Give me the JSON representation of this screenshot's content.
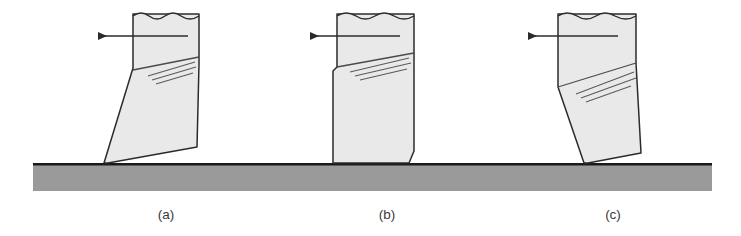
{
  "figure": {
    "background_color": "#ffffff",
    "width": 741,
    "height": 236,
    "workpiece": {
      "name": "workpiece-bar",
      "fill_color": "#9a9a9a",
      "edge_color": "#1a1a1a",
      "x": 33,
      "y": 163,
      "width": 679,
      "height": 28,
      "top_edge_thickness": 2.6
    },
    "tool_fill_color": "#e9e9e9",
    "tool_stroke_color": "#2b2b2b",
    "arrow_color": "#2b2b2b",
    "rake_line_color": "#5a5a5a",
    "panels": [
      {
        "id": "panel-a",
        "caption": "(a)",
        "caption_x": 166,
        "caption_y": 219,
        "rake_type": "positive-rake",
        "arrow": {
          "name": "feed-direction-arrow",
          "direction": "left",
          "tail_x": 188,
          "tip_x": 98,
          "y": 36
        },
        "tool_outline": "133,14 133,68 104,163 108,163 197,147 199,64 199,14",
        "break_line_y": 14,
        "break_line_x1": 133,
        "break_line_x2": 199,
        "rake_face_line": "133,70 199,57",
        "rake_marks": [
          "148,76 195,62",
          "152,80 196,67",
          "156,84 193,73"
        ]
      },
      {
        "id": "panel-b",
        "caption": "(b)",
        "caption_x": 387,
        "caption_y": 219,
        "rake_type": "zero-rake",
        "arrow": {
          "name": "feed-direction-arrow",
          "direction": "left",
          "tail_x": 400,
          "tip_x": 310,
          "y": 36
        },
        "tool_outline": "337,14 337,67 333,71 333,163 409,163 414,151 414,63 414,14",
        "break_line_y": 14,
        "break_line_x1": 337,
        "break_line_x2": 414,
        "rake_face_line": "337,67 414,53",
        "rake_marks": [
          "350,72 409,58",
          "355,76 411,63",
          "360,80 407,69"
        ]
      },
      {
        "id": "panel-c",
        "caption": "(c)",
        "caption_x": 613,
        "caption_y": 219,
        "rake_type": "negative-rake",
        "arrow": {
          "name": "feed-direction-arrow",
          "direction": "left",
          "tail_x": 618,
          "tip_x": 528,
          "y": 36
        },
        "tool_outline": "558,14 558,87 584,163 588,163 641,153 636,63 636,14",
        "break_line_y": 14,
        "break_line_x1": 558,
        "break_line_x2": 636,
        "rake_face_line": "558,87 636,63",
        "rake_marks": [
          "576,94 634,72",
          "581,98 636,78",
          "586,102 631,86"
        ]
      }
    ]
  }
}
